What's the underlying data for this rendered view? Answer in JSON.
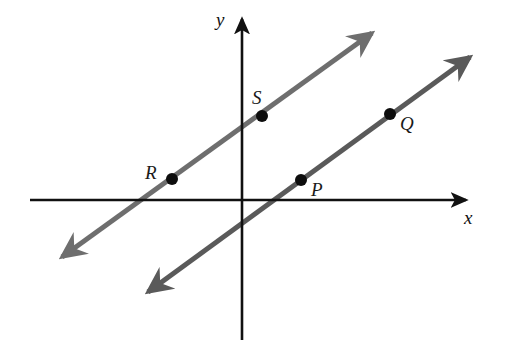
{
  "figure": {
    "background_color": "#ffffff"
  },
  "axes": {
    "color": "#111111",
    "x_label": "x",
    "y_label": "y",
    "origin_px": {
      "x": 242,
      "y": 200
    },
    "x_axis_px": {
      "x1": 30,
      "y1": 200,
      "x2": 468,
      "y2": 200
    },
    "y_axis_px": {
      "x1": 242,
      "y1": 16,
      "x2": 242,
      "y2": 340
    },
    "x_label_pos_px": {
      "x": 464,
      "y": 208
    },
    "y_label_pos_px": {
      "x": 216,
      "y": 10
    }
  },
  "lines": [
    {
      "name": "line-RS",
      "color": "#6e6e6e",
      "stroke_width": 5,
      "double_headed": true,
      "start_px": {
        "x": 62,
        "y": 257
      },
      "end_px": {
        "x": 372,
        "y": 33
      },
      "passes_through": [
        "R",
        "S"
      ],
      "x_intercept_px": 142,
      "y_intercept_px": 129,
      "slope": 0.72
    },
    {
      "name": "line-PQ",
      "color": "#5a5a5a",
      "stroke_width": 5,
      "double_headed": true,
      "start_px": {
        "x": 148,
        "y": 292
      },
      "end_px": {
        "x": 470,
        "y": 57
      },
      "passes_through": [
        "P",
        "Q"
      ],
      "x_intercept_px": 273,
      "y_intercept_px": 237,
      "slope": 0.73
    }
  ],
  "points": [
    {
      "label": "S",
      "dot_px": {
        "x": 262,
        "y": 116
      },
      "label_px": {
        "x": 252,
        "y": 88
      },
      "on_line": "line-RS",
      "quadrant": "I",
      "dot_radius": 6,
      "dot_color": "#0d0d0d"
    },
    {
      "label": "R",
      "dot_px": {
        "x": 172,
        "y": 179
      },
      "label_px": {
        "x": 145,
        "y": 163
      },
      "on_line": "line-RS",
      "quadrant": "II",
      "dot_radius": 6,
      "dot_color": "#0d0d0d"
    },
    {
      "label": "P",
      "dot_px": {
        "x": 301,
        "y": 180
      },
      "label_px": {
        "x": 311,
        "y": 180
      },
      "on_line": "line-PQ",
      "quadrant": "I",
      "dot_radius": 6,
      "dot_color": "#0d0d0d"
    },
    {
      "label": "Q",
      "dot_px": {
        "x": 390,
        "y": 114
      },
      "label_px": {
        "x": 400,
        "y": 114
      },
      "on_line": "line-PQ",
      "quadrant": "I",
      "dot_radius": 6,
      "dot_color": "#0d0d0d"
    }
  ]
}
